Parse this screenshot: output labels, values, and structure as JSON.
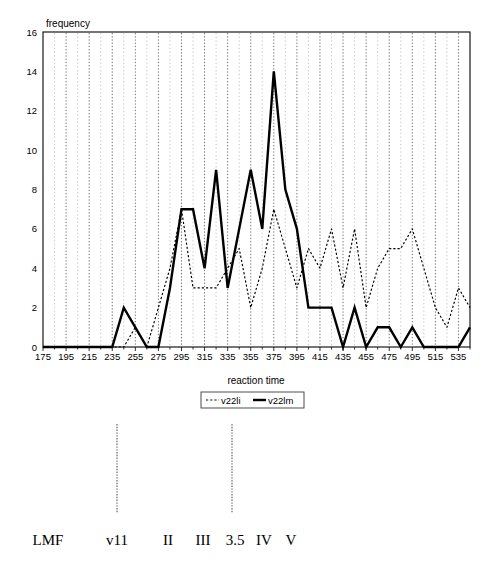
{
  "chart_data": {
    "type": "line",
    "title": "",
    "xlabel": "reaction time",
    "ylabel": "frequency",
    "xlim": [
      175,
      545
    ],
    "ylim": [
      0,
      16
    ],
    "xtick_step": 20,
    "ytick_step": 2,
    "minor_tick_step": 10,
    "grid": "vertical dotted gridlines at every 10 units",
    "legend_position": "below x-axis, centered",
    "xticks": [
      175,
      195,
      215,
      235,
      255,
      275,
      295,
      315,
      335,
      355,
      375,
      395,
      415,
      435,
      455,
      475,
      495,
      515,
      535
    ],
    "yticks": [
      0,
      2,
      4,
      6,
      8,
      10,
      12,
      14,
      16
    ],
    "x": [
      175,
      185,
      195,
      205,
      215,
      225,
      235,
      245,
      255,
      265,
      275,
      285,
      295,
      305,
      315,
      325,
      335,
      345,
      355,
      365,
      375,
      385,
      395,
      405,
      415,
      425,
      435,
      445,
      455,
      465,
      475,
      485,
      495,
      505,
      515,
      525,
      535,
      545
    ],
    "series": [
      {
        "name": "v22li",
        "style": "dotted",
        "color": "#000000",
        "values": [
          0,
          0,
          0,
          0,
          0,
          0,
          0,
          0,
          1,
          0,
          2,
          4,
          7,
          3,
          3,
          3,
          4,
          5,
          2,
          4,
          7,
          5,
          3,
          5,
          4,
          6,
          3,
          6,
          2,
          4,
          5,
          5,
          6,
          4,
          2,
          1,
          3,
          2
        ]
      },
      {
        "name": "v22lm",
        "style": "solid",
        "color": "#000000",
        "values": [
          0,
          0,
          0,
          0,
          0,
          0,
          0,
          2,
          1,
          0,
          0,
          3,
          7,
          7,
          4,
          9,
          3,
          6,
          9,
          6,
          14,
          8,
          6,
          2,
          2,
          2,
          0,
          2,
          0,
          1,
          1,
          0,
          1,
          0,
          0,
          0,
          0,
          1
        ]
      }
    ]
  },
  "legend": {
    "entries": [
      {
        "label": "v22li",
        "style": "dotted"
      },
      {
        "label": "v22lm",
        "style": "solid"
      }
    ]
  },
  "footer": {
    "labels": [
      {
        "text": "LMF",
        "x": 48
      },
      {
        "text": "v11",
        "x": 117
      },
      {
        "text": "II",
        "x": 168
      },
      {
        "text": "III",
        "x": 203
      },
      {
        "text": "3.5",
        "x": 235
      },
      {
        "text": "IV",
        "x": 264
      },
      {
        "text": "V",
        "x": 291
      }
    ],
    "markers": [
      {
        "x": 117,
        "top": 424,
        "bottom": 513
      },
      {
        "x": 232,
        "top": 424,
        "bottom": 513
      }
    ]
  }
}
